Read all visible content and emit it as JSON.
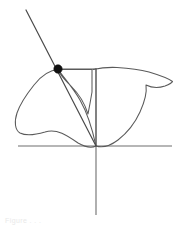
{
  "figure": {
    "name": "polar-curve-tangent-plot",
    "background_color": "#ffffff",
    "width": 182,
    "height": 229,
    "caption_text": "Figure . . ."
  },
  "colors": {
    "axis": "#6e6e6e",
    "curve": "#5a5a5a",
    "tangent": "#4a4a4a",
    "box": "#5a5a5a",
    "point": "#111111",
    "caption": "#e9e9e9"
  },
  "chart_data": {
    "type": "line",
    "title": "",
    "subtitle": "",
    "xlabel": "",
    "ylabel": "",
    "grid": false,
    "legend": "none",
    "origin_px": [
      96,
      146
    ],
    "xlim_px": [
      18,
      172
    ],
    "ylim_px": [
      10,
      215
    ],
    "axes": [
      {
        "name": "x-axis",
        "orientation": "horizontal",
        "x1": 18,
        "y1": 146,
        "x2": 172,
        "y2": 146
      },
      {
        "name": "y-axis",
        "orientation": "vertical",
        "x1": 96,
        "y1": 68,
        "x2": 96,
        "y2": 215
      }
    ],
    "marked_point": {
      "label": "",
      "x_px": 58,
      "y_px": 69,
      "radius_px": 4.2
    },
    "tangent_segment": {
      "label": "",
      "x1": 26,
      "y1": 10,
      "x2": 96,
      "y2": 146
    },
    "reference_box": {
      "label": "",
      "x_left": 58,
      "y_top": 69,
      "x_right": 96,
      "y_bottom": 146
    },
    "curve": {
      "name": "bird-shaped-polar-curve",
      "closed": true,
      "description": "four-petal rose / bird silhouette passing through the origin",
      "path": "M 96 146 C 92 128 86 106 76 94 C 66 82 58 74 58 69 C 58 74 62 82 70 90 C 78 98 86 106 89 116 C 91 106 92 96 92 86 L 92 69 L 58 69 C 52 69 44 74 38 82 C 30 92 24 100 19 110 C 14 120 14 128 18 133 C 23 138 32 138 44 134 C 56 130 68 138 78 144 C 86 148 92 148 96 146 C 100 148 108 148 116 143 C 126 137 134 128 139 117 C 144 106 146 95 145 86 C 150 88 156 88 162 87 C 168 86 171 84 172 82 C 168 80 160 77 150 74 C 140 71 128 69 120 68 C 110 67 102 68 96 69 Z",
      "segments": [
        {
          "name": "inner-left-lobe",
          "from": [
            96,
            146
          ],
          "to": [
            58,
            69
          ]
        },
        {
          "name": "v-notch-top",
          "from": [
            58,
            69
          ],
          "to": [
            92,
            69
          ]
        },
        {
          "name": "left-wing",
          "from": [
            58,
            69
          ],
          "to": [
            96,
            146
          ]
        },
        {
          "name": "right-wing",
          "from": [
            96,
            146
          ],
          "to": [
            145,
            86
          ]
        },
        {
          "name": "upper-right-tip",
          "from": [
            145,
            86
          ],
          "to": [
            172,
            82
          ]
        }
      ]
    }
  }
}
